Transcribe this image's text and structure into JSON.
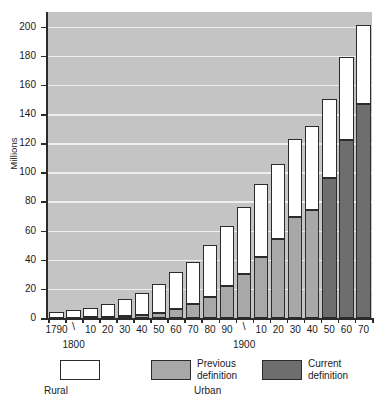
{
  "chart_data": {
    "type": "bar",
    "title": "",
    "xlabel": "",
    "ylabel": "Millions",
    "ylim": [
      0,
      210
    ],
    "ytick_values": [
      0,
      20,
      40,
      60,
      80,
      100,
      120,
      140,
      160,
      180,
      200
    ],
    "ytick_labels": [
      "0",
      "20",
      "40",
      "60",
      "80",
      "100",
      "120",
      "140",
      "160",
      "180",
      "200"
    ],
    "grid": true,
    "stacked": true,
    "legend_position": "below-axes",
    "categories": [
      "1790",
      "1800",
      "10",
      "20",
      "30",
      "40",
      "50",
      "60",
      "70",
      "80",
      "90",
      "1900",
      "10",
      "20",
      "30",
      "40",
      "50",
      "60",
      "70"
    ],
    "tick_labels_shown": [
      "1790",
      "10",
      "20",
      "30",
      "40",
      "50",
      "60",
      "70",
      "80",
      "90",
      "10",
      "20",
      "30",
      "40",
      "50",
      "60",
      "70"
    ],
    "century_markers": [
      "1800",
      "1900"
    ],
    "series": [
      {
        "name": "Urban — Current definition",
        "color": "#6e6e6e",
        "values": [
          0,
          0,
          0,
          0,
          0,
          0,
          0,
          0,
          0,
          0,
          0,
          0,
          0,
          0,
          0,
          0,
          96,
          122,
          147
        ]
      },
      {
        "name": "Urban — Previous definition",
        "color": "#a8a8a8",
        "values": [
          0.2,
          0.3,
          0.5,
          0.7,
          1.1,
          1.8,
          3.5,
          6.2,
          9.9,
          14.1,
          22.1,
          30.2,
          42.0,
          54.2,
          69.0,
          74.4,
          0,
          0,
          0
        ]
      },
      {
        "name": "Rural",
        "color": "#ffffff",
        "values": [
          3.7,
          5.0,
          6.7,
          8.9,
          11.7,
          15.2,
          19.6,
          25.2,
          28.7,
          36.0,
          40.8,
          45.8,
          49.9,
          51.6,
          53.8,
          57.2,
          54.2,
          57.4,
          53.9
        ]
      }
    ],
    "totals": [
      3.9,
      5.3,
      7.2,
      9.6,
      12.8,
      17.0,
      23.1,
      31.4,
      38.6,
      50.1,
      62.9,
      76.0,
      91.9,
      105.8,
      122.8,
      131.6,
      150.2,
      179.4,
      200.9
    ]
  },
  "axis": {
    "y_title": "Millions"
  },
  "legend": {
    "rural": {
      "label": "Rural",
      "swatch": "white"
    },
    "previous": {
      "label": "Previous\ndefinition",
      "swatch": "light-gray"
    },
    "current": {
      "label": "Current\ndefinition",
      "swatch": "dark-gray"
    },
    "urban_group": "Urban"
  },
  "colors": {
    "plot_background": "#c4c4c4",
    "gridline": "#efefef",
    "rural": "#ffffff",
    "previous_definition": "#a8a8a8",
    "current_definition": "#6e6e6e",
    "outline": "#2b2b2b"
  }
}
